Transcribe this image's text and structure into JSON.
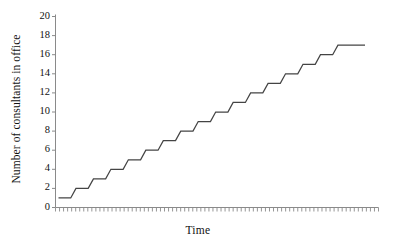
{
  "chart_data": {
    "type": "line",
    "variant": "step-post",
    "title": "",
    "xlabel": "Time",
    "ylabel": "Number of consultants in office",
    "ylim": [
      0,
      20
    ],
    "ytick_values": [
      0,
      2,
      4,
      6,
      8,
      10,
      12,
      14,
      16,
      18,
      20
    ],
    "ytick_labels": [
      "0",
      "2",
      "4",
      "6",
      "8",
      "10",
      "12",
      "14",
      "16",
      "18",
      "20"
    ],
    "xlim": [
      0,
      80
    ],
    "xtick_labels": [],
    "x_minor_tick_count": 80,
    "grid": false,
    "legend": null,
    "line_color": "#444444",
    "axis_color": "#8a8a8a",
    "background": "#ffffff",
    "series": [
      {
        "name": "Consultants in office",
        "x": [
          0,
          4,
          6,
          10,
          12,
          16,
          18,
          22,
          24,
          28,
          30,
          34,
          36,
          40,
          42,
          46,
          48,
          52,
          54,
          58,
          60,
          64,
          66,
          70,
          72,
          76,
          78,
          82,
          84,
          88,
          90,
          94,
          96,
          100,
          102,
          106
        ],
        "values": [
          1,
          1,
          2,
          2,
          3,
          3,
          4,
          4,
          5,
          5,
          6,
          6,
          7,
          7,
          8,
          8,
          9,
          9,
          10,
          10,
          11,
          11,
          12,
          12,
          13,
          13,
          14,
          14,
          15,
          15,
          16,
          16,
          17,
          17,
          17,
          17
        ]
      }
    ],
    "step_values": [
      1,
      2,
      3,
      4,
      5,
      6,
      7,
      8,
      9,
      10,
      11,
      12,
      13,
      14,
      15,
      16,
      17
    ],
    "start_value": 1,
    "end_value": 17
  }
}
